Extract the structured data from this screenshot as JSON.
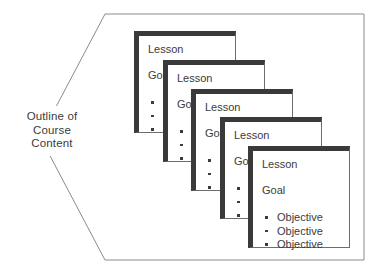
{
  "diagram": {
    "title_label": {
      "lines": [
        "Outline of",
        "Course",
        "Content"
      ]
    },
    "frame": {
      "shape": "left-pointing-pentagon",
      "stroke_color": "#8a8a8a"
    },
    "card_style": {
      "shadow_color": "#3a3a3a",
      "border_color": "#6d6d6d",
      "background": "#ffffff",
      "text_color": "#3b3b3b"
    },
    "cards": [
      {
        "title": "Lesson",
        "goal": "Goal",
        "objectives": [
          "Objective",
          "Objective",
          "Objective"
        ]
      },
      {
        "title": "Lesson",
        "goal": "Goal",
        "objectives": [
          "Objective",
          "Objective",
          "Objective"
        ]
      },
      {
        "title": "Lesson",
        "goal": "Goal",
        "objectives": [
          "Objective",
          "Objective",
          "Objective"
        ]
      },
      {
        "title": "Lesson",
        "goal": "Goal",
        "objectives": [
          "Objective",
          "Objective",
          "Objective"
        ]
      },
      {
        "title": "Lesson",
        "goal": "Goal",
        "objectives": [
          "Objective",
          "Objective",
          "Objective"
        ]
      }
    ]
  }
}
